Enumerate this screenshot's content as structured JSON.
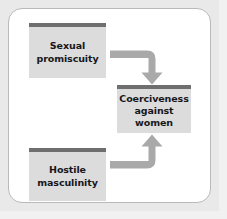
{
  "diagram": {
    "title_visible": false,
    "background_color": "#e9e9e9",
    "frame_color": "#ffffff",
    "node_fill": "#dcdcdc",
    "node_accent_bar": "#6f6f6f",
    "arrow_color": "#a9a9a9",
    "text_color": "#17171b",
    "nodes": [
      {
        "id": "sexual-promiscuity",
        "label": "Sexual\npromiscuity",
        "line1": "Sexual",
        "line2": "promiscuity",
        "line3": ""
      },
      {
        "id": "coerciveness-against-women",
        "label": "Coerciveness\nagainst\nwomen",
        "line1": "Coerciveness",
        "line2": "against",
        "line3": "women"
      },
      {
        "id": "hostile-masculinity",
        "label": "Hostile\nmasculinity",
        "line1": "Hostile",
        "line2": "masculinity",
        "line3": ""
      }
    ],
    "edges": [
      {
        "id": "promiscuity-to-coerciveness",
        "from": "sexual-promiscuity",
        "to": "coerciveness-against-women",
        "shape": "elbow-right-then-down",
        "arrowhead": "down"
      },
      {
        "id": "masculinity-to-coerciveness",
        "from": "hostile-masculinity",
        "to": "coerciveness-against-women",
        "shape": "elbow-right-then-up",
        "arrowhead": "up"
      }
    ]
  }
}
